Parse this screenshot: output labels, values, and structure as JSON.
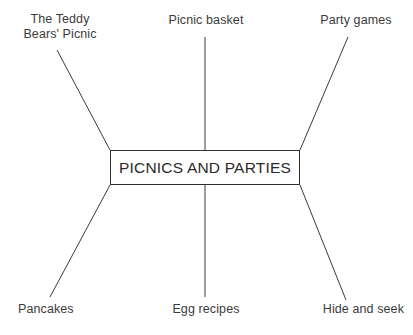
{
  "diagram": {
    "type": "spider-mind-map",
    "background_color": "#ffffff",
    "line_color": "#3a3a3a",
    "text_color": "#3b3b3b",
    "center": {
      "label": "PICNICS AND PARTIES"
    },
    "branches": [
      {
        "id": "teddy-bears-picnic",
        "label": "The Teddy\nBears' Picnic",
        "position": "top-left",
        "align": "center"
      },
      {
        "id": "picnic-basket",
        "label": "Picnic basket",
        "position": "top-center",
        "align": "center"
      },
      {
        "id": "party-games",
        "label": "Party games",
        "position": "top-right",
        "align": "center"
      },
      {
        "id": "pancakes",
        "label": "Pancakes",
        "position": "bottom-left",
        "align": "left"
      },
      {
        "id": "egg-recipes",
        "label": "Egg recipes",
        "position": "bottom-center",
        "align": "center"
      },
      {
        "id": "hide-and-seek",
        "label": "Hide and seek",
        "position": "bottom-right",
        "align": "right"
      }
    ]
  }
}
